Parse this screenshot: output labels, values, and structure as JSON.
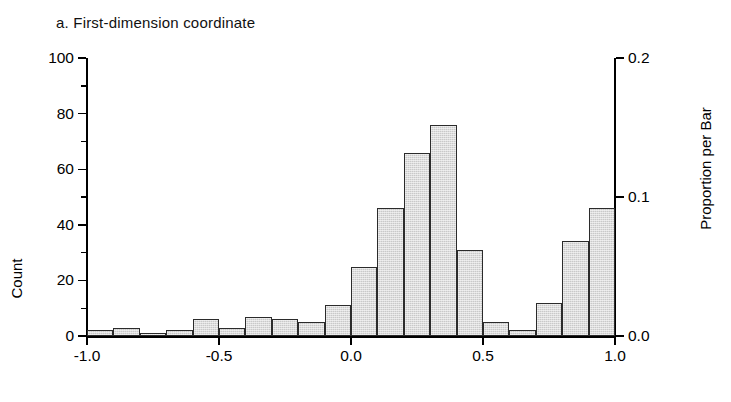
{
  "figure": {
    "panel_label": "a. First-dimension coordinate"
  },
  "axes": {
    "left": {
      "title": "Count",
      "ticks_major": [
        "0",
        "20",
        "40",
        "60",
        "80",
        "100"
      ],
      "tick_values_major": [
        0,
        20,
        40,
        60,
        80,
        100
      ],
      "tick_values_minor": [
        10,
        30,
        50,
        70,
        90
      ],
      "range": [
        0,
        100
      ]
    },
    "right": {
      "title": "Proportion per Bar",
      "ticks_major": [
        "0.0",
        "0.1",
        "0.2"
      ],
      "tick_values_major": [
        0.0,
        0.1,
        0.2
      ],
      "range": [
        0,
        0.2
      ]
    },
    "bottom": {
      "title": "",
      "ticks_major": [
        "-1.0",
        "-0.5",
        "0.0",
        "0.5",
        "1.0"
      ],
      "tick_values_major": [
        -1.0,
        -0.5,
        0.0,
        0.5,
        1.0
      ],
      "range": [
        -1.0,
        1.0
      ]
    }
  },
  "style": {
    "bar_fill": "#c9c9c9",
    "bar_stroke": "#2b2b2b",
    "axis_color": "#000000",
    "background": "#ffffff"
  },
  "chart_data": {
    "type": "bar",
    "title": "a. First-dimension coordinate",
    "xlabel": "",
    "ylabel": "Count",
    "y2label": "Proportion per Bar",
    "xlim": [
      -1.0,
      1.0
    ],
    "ylim": [
      0,
      100
    ],
    "y2lim": [
      0,
      0.2
    ],
    "grid": false,
    "legend": "none",
    "bin_width": 0.1,
    "bin_edges": [
      -1.0,
      -0.9,
      -0.8,
      -0.7,
      -0.6,
      -0.5,
      -0.4,
      -0.3,
      -0.2,
      -0.1,
      0.0,
      0.1,
      0.2,
      0.3,
      0.4,
      0.5,
      0.6,
      0.7,
      0.8,
      0.9,
      1.0
    ],
    "categories": [
      "-1.0 to -0.9",
      "-0.9 to -0.8",
      "-0.8 to -0.7",
      "-0.7 to -0.6",
      "-0.6 to -0.5",
      "-0.5 to -0.4",
      "-0.4 to -0.3",
      "-0.3 to -0.2",
      "-0.2 to -0.1",
      "-0.1 to 0.0",
      "0.0 to 0.1",
      "0.1 to 0.2",
      "0.2 to 0.3",
      "0.3 to 0.4",
      "0.4 to 0.5",
      "0.5 to 0.6",
      "0.6 to 0.7",
      "0.7 to 0.8",
      "0.8 to 0.9",
      "0.9 to 1.0"
    ],
    "values": [
      2,
      3,
      1,
      2,
      6,
      3,
      7,
      6,
      5,
      11,
      25,
      46,
      66,
      76,
      31,
      5,
      2,
      12,
      34,
      46
    ],
    "series": [
      {
        "name": "Count",
        "values": [
          2,
          3,
          1,
          2,
          6,
          3,
          7,
          6,
          5,
          11,
          25,
          46,
          66,
          76,
          31,
          5,
          2,
          12,
          34,
          46
        ]
      }
    ],
    "note": "Bimodal histogram of first-dimension coordinates; major mode near 0.15, secondary mode near 0.7"
  },
  "bars": [
    {
      "x0": -1.0,
      "x1": -0.9,
      "count": 2
    },
    {
      "x0": -0.9,
      "x1": -0.8,
      "count": 3
    },
    {
      "x0": -0.8,
      "x1": -0.7,
      "count": 1
    },
    {
      "x0": -0.7,
      "x1": -0.6,
      "count": 2
    },
    {
      "x0": -0.6,
      "x1": -0.5,
      "count": 6
    },
    {
      "x0": -0.5,
      "x1": -0.4,
      "count": 3
    },
    {
      "x0": -0.4,
      "x1": -0.3,
      "count": 7
    },
    {
      "x0": -0.3,
      "x1": -0.2,
      "count": 6
    },
    {
      "x0": -0.2,
      "x1": -0.1,
      "count": 5
    },
    {
      "x0": -0.1,
      "x1": 0.0,
      "count": 11
    },
    {
      "x0": 0.0,
      "x1": 0.1,
      "count": 25
    },
    {
      "x0": 0.1,
      "x1": 0.2,
      "count": 46
    },
    {
      "x0": 0.2,
      "x1": 0.3,
      "count": 66
    },
    {
      "x0": 0.3,
      "x1": 0.4,
      "count": 76
    },
    {
      "x0": 0.4,
      "x1": 0.5,
      "count": 31
    },
    {
      "x0": 0.5,
      "x1": 0.6,
      "count": 5
    },
    {
      "x0": 0.6,
      "x1": 0.7,
      "count": 2
    },
    {
      "x0": 0.7,
      "x1": 0.8,
      "count": 12
    },
    {
      "x0": 0.8,
      "x1": 0.9,
      "count": 34
    },
    {
      "x0": 0.9,
      "x1": 1.0,
      "count": 46
    }
  ]
}
